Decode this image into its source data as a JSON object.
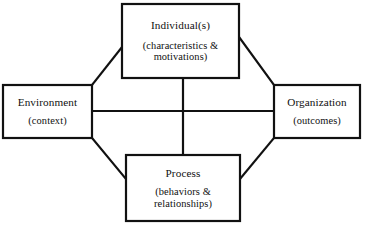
{
  "diagram": {
    "type": "conceptual-framework",
    "background_color": "#ffffff",
    "line_color": "#111111",
    "text_color": "#101010",
    "nodes": [
      {
        "id": "individual",
        "title": "Individual(s)",
        "subtitle_lines": [
          "(characteristics &",
          "motivations)"
        ],
        "x": 122,
        "y": 4,
        "w": 117,
        "h": 74
      },
      {
        "id": "environment",
        "title": "Environment",
        "subtitle_lines": [
          "(context)"
        ],
        "x": 3,
        "y": 85,
        "w": 89,
        "h": 53
      },
      {
        "id": "organization",
        "title": "Organization",
        "subtitle_lines": [
          "(outcomes)"
        ],
        "x": 274,
        "y": 85,
        "w": 86,
        "h": 53
      },
      {
        "id": "process",
        "title": "Process",
        "subtitle_lines": [
          "(behaviors &",
          "relationships)"
        ],
        "x": 126,
        "y": 155,
        "w": 114,
        "h": 66
      }
    ],
    "connectors": [
      {
        "id": "environment-organization",
        "kind": "horizontal",
        "x1": 92,
        "y1": 111,
        "x2": 274,
        "y2": 111
      },
      {
        "id": "individual-process",
        "kind": "vertical",
        "x1": 183,
        "y1": 78,
        "x2": 183,
        "y2": 155
      },
      {
        "id": "individual-environment",
        "kind": "diagonal",
        "x1": 122,
        "y1": 47,
        "x2": 92,
        "y2": 85
      },
      {
        "id": "individual-organization",
        "kind": "diagonal",
        "x1": 239,
        "y1": 37,
        "x2": 274,
        "y2": 85
      },
      {
        "id": "environment-process",
        "kind": "diagonal",
        "x1": 92,
        "y1": 138,
        "x2": 126,
        "y2": 179
      },
      {
        "id": "process-organization",
        "kind": "diagonal",
        "x1": 240,
        "y1": 179,
        "x2": 274,
        "y2": 138
      }
    ]
  }
}
